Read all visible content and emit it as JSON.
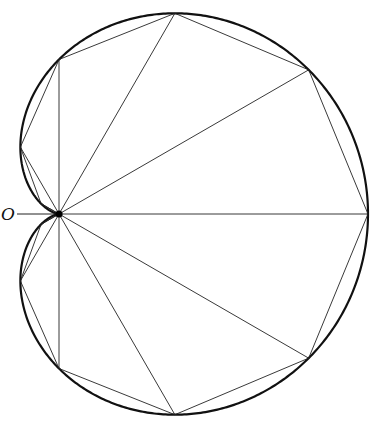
{
  "figure": {
    "type": "cardioid-polygon-approximation",
    "origin_label": "O",
    "curve_equation": "r = a(1 + cos θ)",
    "vertex_angles_deg": [
      0,
      30,
      60,
      90,
      120,
      150,
      180,
      210,
      240,
      270,
      300,
      330
    ],
    "colors": {
      "background": "#ffffff",
      "curve": "#111111",
      "lines": "#222222"
    }
  }
}
